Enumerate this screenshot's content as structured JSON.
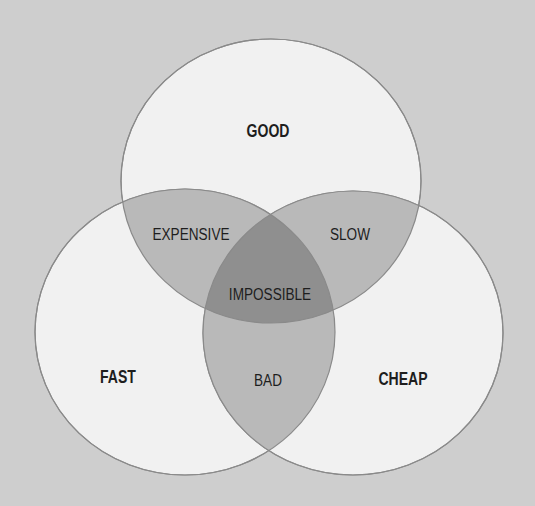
{
  "diagram": {
    "type": "venn",
    "colors": {
      "background": "#cecece",
      "circle_fill": "#f1f1f1",
      "circle_stroke": "#8a8a8a",
      "pair_overlap": "#b9b9b9",
      "triple_overlap": "#8f8f8f",
      "text": "#1e1e1e"
    },
    "sets": [
      {
        "id": "good",
        "label": "GOOD"
      },
      {
        "id": "fast",
        "label": "FAST"
      },
      {
        "id": "cheap",
        "label": "CHEAP"
      }
    ],
    "intersections": [
      {
        "sets": [
          "good",
          "fast"
        ],
        "label": "EXPENSIVE"
      },
      {
        "sets": [
          "good",
          "cheap"
        ],
        "label": "SLOW"
      },
      {
        "sets": [
          "fast",
          "cheap"
        ],
        "label": "BAD"
      },
      {
        "sets": [
          "good",
          "fast",
          "cheap"
        ],
        "label": "IMPOSSIBLE"
      }
    ]
  }
}
